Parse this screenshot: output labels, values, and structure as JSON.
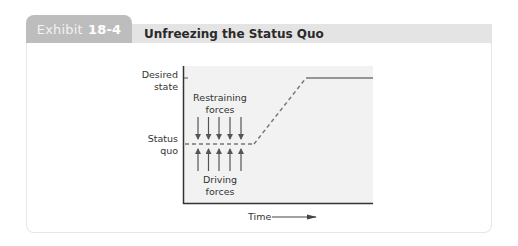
{
  "exhibit": {
    "tab_label": "Exhibit",
    "tab_number": "18-4",
    "title": "Unfreezing the Status Quo"
  },
  "diagram": {
    "y_labels": {
      "desired_line1": "Desired",
      "desired_line2": "state",
      "status_line1": "Status",
      "status_line2": "quo"
    },
    "restraining_line1": "Restraining",
    "restraining_line2": "forces",
    "driving_line1": "Driving",
    "driving_line2": "forces",
    "x_label": "Time",
    "arrow_count": 5
  },
  "colors": {
    "tab_bg": "#bdbdbd",
    "header_bg": "#e4e4e4",
    "plot_bg": "#f2f2f2",
    "line": "#777777",
    "axis": "#333333"
  }
}
